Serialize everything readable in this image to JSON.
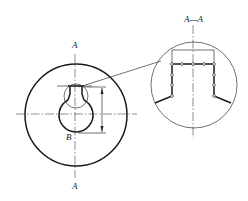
{
  "figure": {
    "type": "technical-drawing",
    "labels": {
      "section_top": "A",
      "section_bottom": "A",
      "point_b": "B",
      "detail_title": "A—A"
    },
    "colors": {
      "line": "#1a1a1a",
      "background": "#ffffff"
    }
  }
}
